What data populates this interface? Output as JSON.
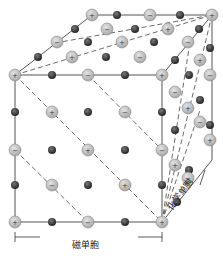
{
  "diagram": {
    "labels": {
      "magnetic_cell": "磁单胞",
      "chemical_cell": "化学单胞",
      "caption": "图 ... 磁单胞与化学单胞"
    },
    "colors": {
      "ion_fill": "#c8c8c8",
      "ion_stroke": "#888888",
      "dark_atom": "#333333",
      "edge": "#555555"
    },
    "legend": {
      "plus_symbol": "+",
      "minus_symbol": "−"
    }
  }
}
